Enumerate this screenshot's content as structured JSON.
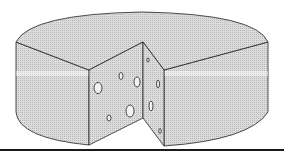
{
  "illustration": {
    "subject": "cheese wheel with wedge cut out",
    "colors": {
      "background": "#ffffff",
      "cheese_fill": "#d4d4d4",
      "outline": "#222222",
      "ground_line": "#1a1a1a"
    },
    "holes_count": 9
  }
}
